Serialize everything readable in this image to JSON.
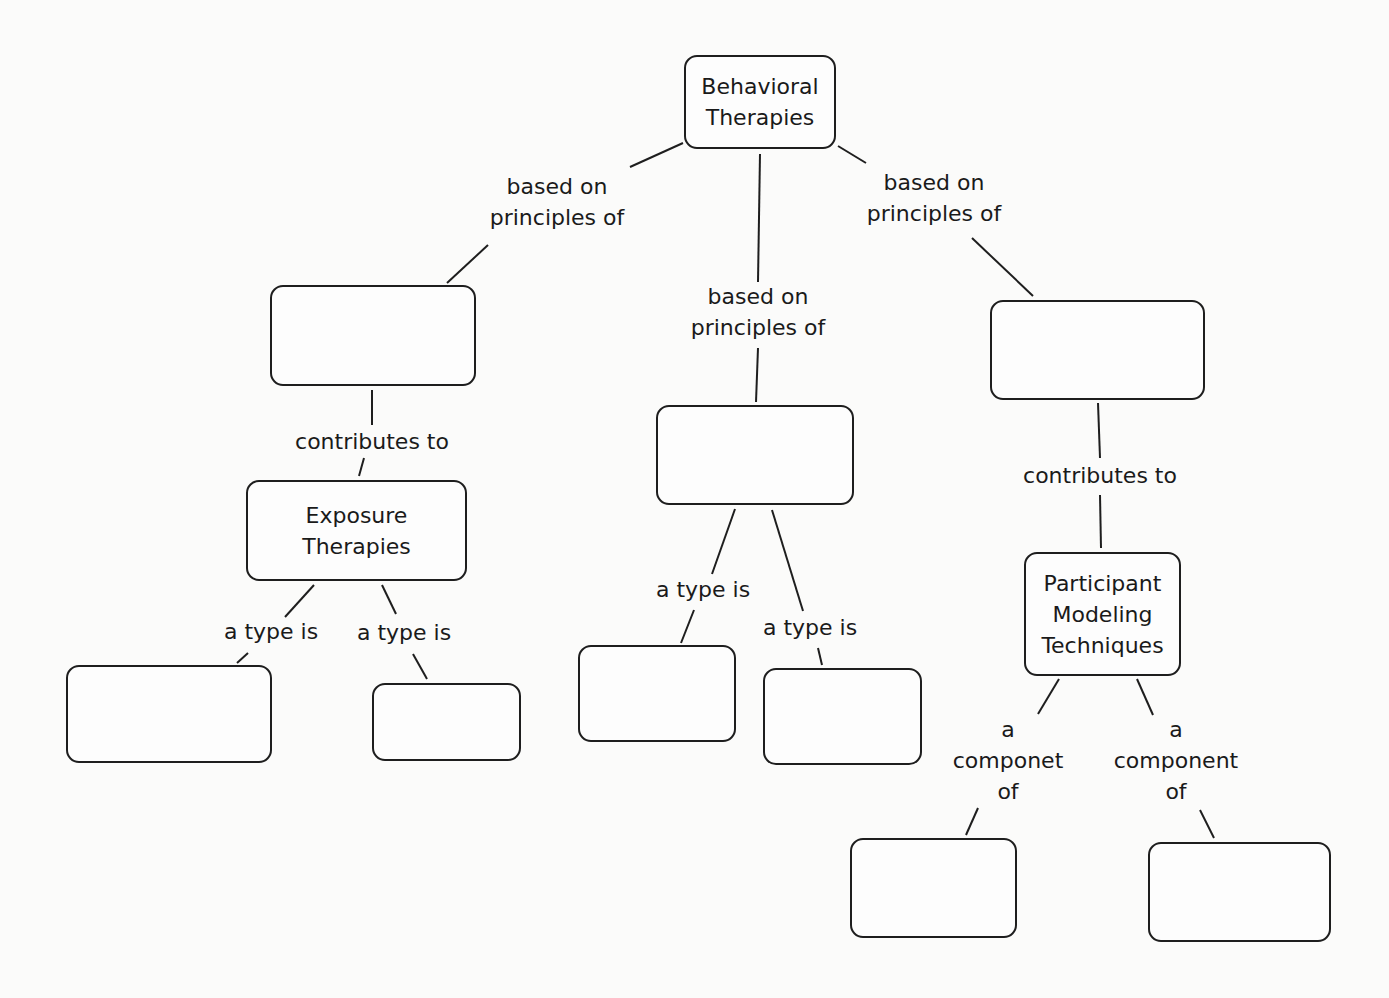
{
  "diagram": {
    "type": "concept-map",
    "nodes": {
      "root": {
        "label": "Behavioral\nTherapies"
      },
      "left_blank": {
        "label": ""
      },
      "middle_blank": {
        "label": ""
      },
      "right_blank": {
        "label": ""
      },
      "exposure": {
        "label": "Exposure\nTherapies"
      },
      "participant": {
        "label": "Participant\nModeling\nTechniques"
      },
      "exposure_type_1": {
        "label": ""
      },
      "exposure_type_2": {
        "label": ""
      },
      "middle_type_1": {
        "label": ""
      },
      "middle_type_2": {
        "label": ""
      },
      "participant_component_1": {
        "label": ""
      },
      "participant_component_2": {
        "label": ""
      }
    },
    "links": {
      "root_left": {
        "label": "based on\nprinciples of"
      },
      "root_middle": {
        "label": "based on\nprinciples of"
      },
      "root_right": {
        "label": "based on\nprinciples of"
      },
      "left_exposure": {
        "label": "contributes to"
      },
      "right_participant": {
        "label": "contributes to"
      },
      "exposure_type_1": {
        "label": "a type is"
      },
      "exposure_type_2": {
        "label": "a type is"
      },
      "middle_type_1": {
        "label": "a type is"
      },
      "middle_type_2": {
        "label": "a type is"
      },
      "participant_component_1": {
        "label": "a\ncomponet\nof"
      },
      "participant_component_2": {
        "label": "a\ncomponent\nof"
      }
    }
  }
}
